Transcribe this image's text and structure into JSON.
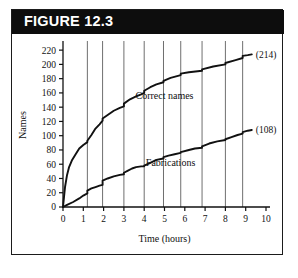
{
  "figure": {
    "banner_label": "FIGURE 12.3",
    "banner_bg": "#0d0d0d",
    "banner_text_color": "#ffffff",
    "border_color": "#1b1b1b",
    "background": "#ffffff"
  },
  "chart_data": {
    "type": "line",
    "title": "FIGURE 12.3",
    "xlabel": "Time (hours)",
    "ylabel": "Names",
    "xlim": [
      0,
      10
    ],
    "ylim": [
      0,
      230
    ],
    "xticks": [
      0,
      1,
      2,
      3,
      4,
      5,
      6,
      7,
      8,
      9,
      10
    ],
    "xtick_labels": [
      "0",
      "1",
      "2",
      "3",
      "4",
      "5",
      "6",
      "7",
      "8",
      "9",
      "10"
    ],
    "yticks": [
      0,
      20,
      40,
      60,
      80,
      100,
      120,
      140,
      160,
      180,
      200,
      220
    ],
    "ytick_labels": [
      "0",
      "20",
      "40",
      "60",
      "80",
      "100",
      "120",
      "140",
      "160",
      "180",
      "200",
      "220"
    ],
    "grid": "vertical-only",
    "gridlines_x": [
      1.2,
      1.95,
      3.0,
      4.0,
      4.95,
      5.8,
      6.85,
      8.0,
      8.85
    ],
    "gridline_color": "#6f6f6f",
    "legend": "inline-annotations",
    "line_color": "#111111",
    "series": [
      {
        "name": "Correct names",
        "label": "Correct names",
        "endpoint_label": "(214)",
        "endpoint_value": 214,
        "label_x": 5.0,
        "label_y": 152,
        "x": [
          0.0,
          0.05,
          0.1,
          0.2,
          0.3,
          0.45,
          0.6,
          0.8,
          1.0,
          1.2,
          1.2,
          1.4,
          1.6,
          1.8,
          1.95,
          1.95,
          2.2,
          2.5,
          2.8,
          3.0,
          3.0,
          3.3,
          3.6,
          3.85,
          4.0,
          4.0,
          4.3,
          4.6,
          4.95,
          4.95,
          5.3,
          5.8,
          5.8,
          6.2,
          6.85,
          6.85,
          7.4,
          8.0,
          8.0,
          8.5,
          8.85,
          8.85,
          9.1,
          9.3
        ],
        "y": [
          0,
          14,
          28,
          45,
          56,
          66,
          73,
          82,
          87,
          91,
          93,
          101,
          110,
          116,
          121,
          124,
          129,
          135,
          139,
          141,
          145,
          151,
          155,
          158,
          160,
          163,
          168,
          172,
          175,
          177,
          181,
          185,
          187,
          189,
          191,
          193,
          197,
          200,
          202,
          206,
          209,
          212,
          213,
          214
        ]
      },
      {
        "name": "Fabrications",
        "label": "Fabrications",
        "endpoint_label": "(108)",
        "endpoint_value": 108,
        "label_x": 5.3,
        "label_y": 58,
        "x": [
          0.0,
          0.2,
          0.5,
          0.8,
          1.0,
          1.2,
          1.2,
          1.4,
          1.6,
          1.8,
          1.95,
          1.95,
          2.2,
          2.5,
          2.8,
          3.0,
          3.0,
          3.2,
          3.4,
          3.6,
          3.85,
          4.0,
          4.0,
          4.3,
          4.6,
          4.95,
          4.95,
          5.2,
          5.5,
          5.8,
          5.8,
          6.2,
          6.5,
          6.85,
          6.85,
          7.2,
          7.6,
          8.0,
          8.0,
          8.3,
          8.6,
          8.85,
          8.85,
          9.1,
          9.3
        ],
        "y": [
          0,
          3,
          7,
          12,
          16,
          19,
          23,
          26,
          28,
          30,
          31,
          37,
          40,
          43,
          45,
          46,
          48,
          51,
          54,
          56,
          57,
          57,
          58,
          62,
          66,
          68,
          70,
          72,
          74,
          76,
          77,
          80,
          82,
          83,
          85,
          89,
          92,
          94,
          95,
          98,
          101,
          103,
          105,
          107,
          108
        ]
      }
    ]
  }
}
